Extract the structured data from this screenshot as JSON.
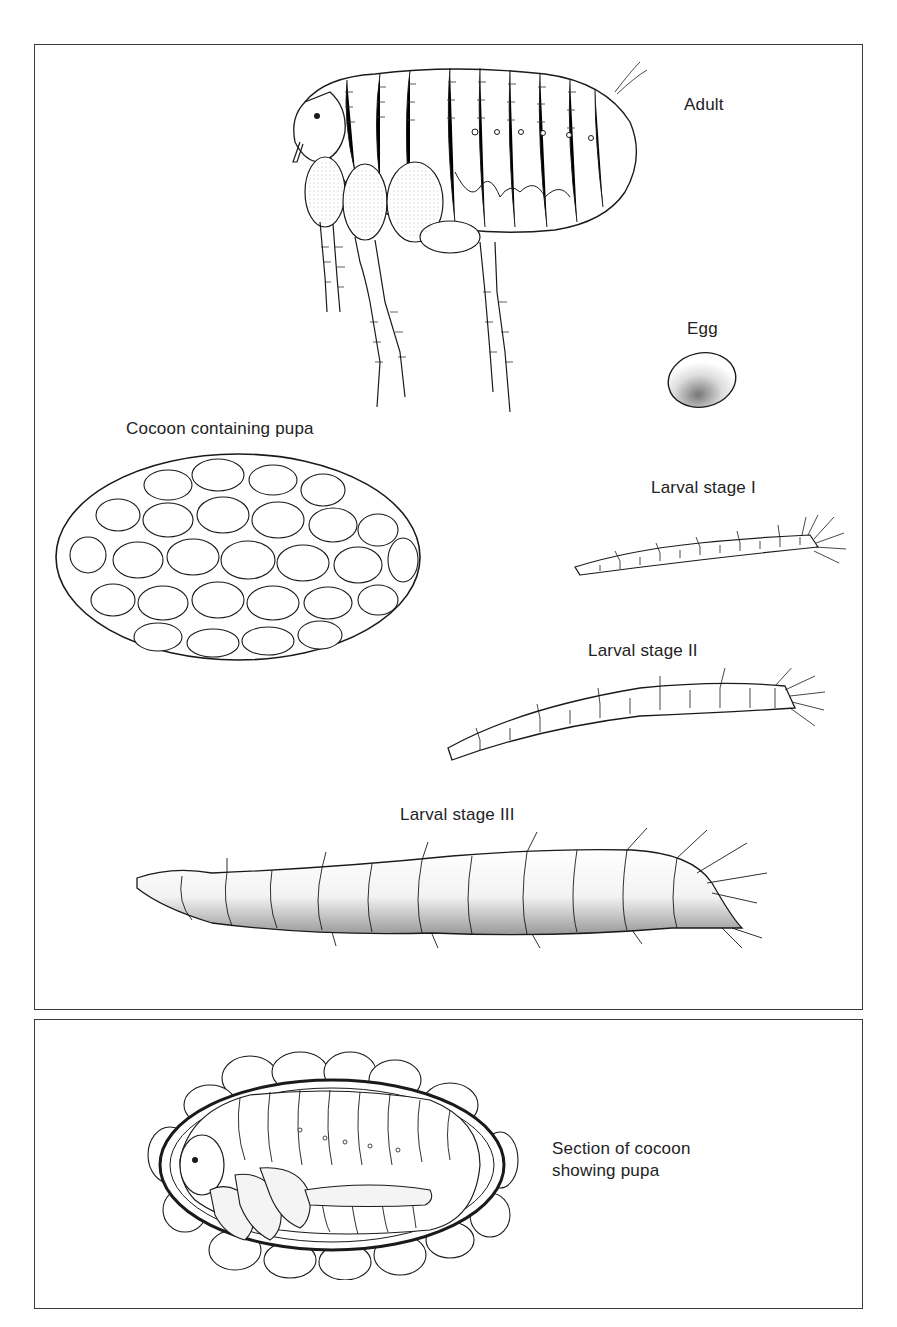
{
  "figure": {
    "panels": [
      {
        "id": "life-stages",
        "labels": {
          "adult": "Adult",
          "egg": "Egg",
          "cocoon": "Cocoon containing pupa",
          "larva_1": "Larval stage I",
          "larva_2": "Larval stage II",
          "larva_3": "Larval stage III"
        }
      },
      {
        "id": "cocoon-section",
        "labels": {
          "section_line1": "Section of cocoon",
          "section_line2": "showing pupa"
        }
      }
    ],
    "colors": {
      "ink": "#1a1a1a",
      "frame": "#3a3a3a",
      "background": "#ffffff"
    }
  }
}
